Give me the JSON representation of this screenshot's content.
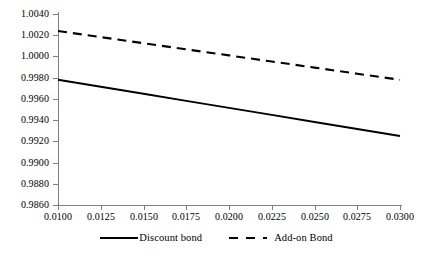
{
  "chart_data": {
    "type": "line",
    "title": "",
    "xlabel": "",
    "ylabel": "",
    "xlim": [
      0.01,
      0.03
    ],
    "ylim": [
      0.986,
      1.004
    ],
    "grid": false,
    "legend_position": "bottom-center",
    "x": [
      0.01,
      0.0125,
      0.015,
      0.0175,
      0.02,
      0.0225,
      0.025,
      0.0275,
      0.03
    ],
    "xtick_labels": [
      "0.0100",
      "0.0125",
      "0.0150",
      "0.0175",
      "0.0200",
      "0.0225",
      "0.0250",
      "0.0275",
      "0.0300"
    ],
    "ytick_values": [
      1.004,
      1.002,
      1.0,
      0.998,
      0.996,
      0.994,
      0.992,
      0.99,
      0.988,
      0.986
    ],
    "ytick_labels": [
      "1.0040",
      "1.0020",
      "1.0000",
      "0.9980",
      "0.9960",
      "0.9940",
      "0.9920",
      "0.9900",
      "0.9880",
      "0.9860"
    ],
    "series": [
      {
        "name": "Discount bond",
        "style": "solid",
        "color": "#000000",
        "values": [
          0.9978,
          0.99714,
          0.99648,
          0.99581,
          0.99515,
          0.99449,
          0.99382,
          0.99316,
          0.9925
        ]
      },
      {
        "name": "Add-on Bond",
        "style": "dashed",
        "color": "#000000",
        "values": [
          1.0024,
          1.00182,
          1.00125,
          1.00067,
          1.0001,
          0.99952,
          0.99895,
          0.99837,
          0.9978
        ]
      }
    ]
  },
  "legend": {
    "entries": [
      {
        "label": "Discount bond",
        "style": "solid"
      },
      {
        "label": "Add-on Bond",
        "style": "dashed"
      }
    ]
  },
  "colors": {
    "series_line": "#000000",
    "axis": "#7f7f7f",
    "background": "#ffffff"
  }
}
